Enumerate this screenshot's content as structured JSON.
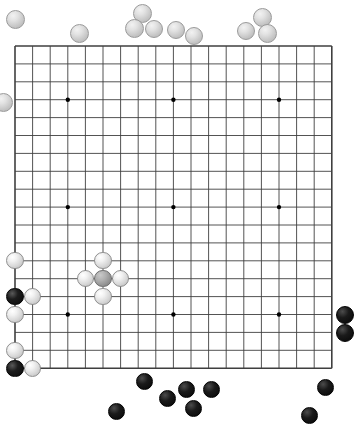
{
  "app": {
    "title": "Go Board Position",
    "board_size": 19,
    "background_color": "#ffffff",
    "line_color": "#3f3f3f",
    "star_color": "#000000"
  },
  "board": {
    "origin_x": 15,
    "origin_y": 46,
    "spacing_x": 17.6,
    "spacing_y": 17.9,
    "lines": 19,
    "star_points": [
      {
        "col": 3,
        "row": 3
      },
      {
        "col": 9,
        "row": 3
      },
      {
        "col": 15,
        "row": 3
      },
      {
        "col": 3,
        "row": 9
      },
      {
        "col": 9,
        "row": 9
      },
      {
        "col": 15,
        "row": 9
      },
      {
        "col": 3,
        "row": 15
      },
      {
        "col": 9,
        "row": 15
      },
      {
        "col": 15,
        "row": 15
      }
    ],
    "stone_radius": 8.6,
    "stones": [
      {
        "col": 0,
        "row": 12,
        "color": "white"
      },
      {
        "col": 4,
        "row": 13,
        "color": "white"
      },
      {
        "col": 5,
        "row": 12,
        "color": "white"
      },
      {
        "col": 5,
        "row": 13,
        "color": "gray",
        "marked": true
      },
      {
        "col": 6,
        "row": 13,
        "color": "white"
      },
      {
        "col": 5,
        "row": 14,
        "color": "white"
      },
      {
        "col": 0,
        "row": 14,
        "color": "black"
      },
      {
        "col": 1,
        "row": 14,
        "color": "white"
      },
      {
        "col": 0,
        "row": 15,
        "color": "white"
      },
      {
        "col": 0,
        "row": 17,
        "color": "white"
      },
      {
        "col": 0,
        "row": 18,
        "color": "black"
      },
      {
        "col": 1,
        "row": 18,
        "color": "white"
      }
    ]
  },
  "captured": {
    "white_bowl_label": "Captured white stones",
    "black_bowl_label": "Captured black stones",
    "white_count": 13,
    "black_count": 10,
    "white_stones": [
      {
        "x": 15,
        "y": 19,
        "r": 9.5
      },
      {
        "x": 3,
        "y": 102,
        "r": 9.5
      },
      {
        "x": 79,
        "y": 33,
        "r": 9.5
      },
      {
        "x": 142,
        "y": 13,
        "r": 9.5
      },
      {
        "x": 134,
        "y": 28,
        "r": 9.5
      },
      {
        "x": 154,
        "y": 29,
        "r": 9.0
      },
      {
        "x": 176,
        "y": 30,
        "r": 9.0
      },
      {
        "x": 194,
        "y": 36,
        "r": 9.0
      },
      {
        "x": 246,
        "y": 31,
        "r": 9.0
      },
      {
        "x": 262,
        "y": 17,
        "r": 9.5
      },
      {
        "x": 267,
        "y": 33,
        "r": 9.5
      }
    ],
    "black_stones": [
      {
        "x": 345,
        "y": 315,
        "r": 9.0
      },
      {
        "x": 345,
        "y": 333,
        "r": 9.0
      },
      {
        "x": 144,
        "y": 381,
        "r": 8.5
      },
      {
        "x": 116,
        "y": 411,
        "r": 8.5
      },
      {
        "x": 167,
        "y": 398,
        "r": 8.5
      },
      {
        "x": 186,
        "y": 389,
        "r": 8.5
      },
      {
        "x": 211,
        "y": 389,
        "r": 8.5
      },
      {
        "x": 193,
        "y": 408,
        "r": 8.5
      },
      {
        "x": 325,
        "y": 387,
        "r": 8.5
      },
      {
        "x": 309,
        "y": 415,
        "r": 8.5
      }
    ]
  }
}
